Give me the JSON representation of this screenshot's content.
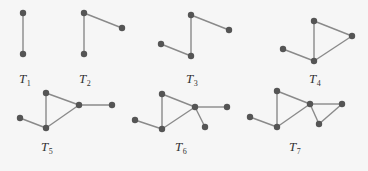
{
  "diagram": {
    "colors": {
      "background": "#f6f6f6",
      "edge": "#8a8a8a",
      "node": "#555555",
      "label": "#333333"
    },
    "graphs": [
      {
        "id": "T1",
        "label_main": "T",
        "label_sub": "1",
        "label_pos": [
          19,
          83
        ],
        "nodes": [
          [
            23,
            13
          ],
          [
            23,
            54
          ]
        ],
        "edges": [
          [
            0,
            1
          ]
        ]
      },
      {
        "id": "T2",
        "label_main": "T",
        "label_sub": "2",
        "label_pos": [
          79,
          83
        ],
        "nodes": [
          [
            84,
            13
          ],
          [
            84,
            54
          ],
          [
            122,
            28
          ]
        ],
        "edges": [
          [
            0,
            1
          ],
          [
            0,
            2
          ]
        ]
      },
      {
        "id": "T3",
        "label_main": "T",
        "label_sub": "3",
        "label_pos": [
          186,
          83
        ],
        "nodes": [
          [
            161,
            44
          ],
          [
            191,
            56
          ],
          [
            191,
            15
          ],
          [
            229,
            30
          ]
        ],
        "edges": [
          [
            0,
            1
          ],
          [
            1,
            2
          ],
          [
            2,
            3
          ]
        ]
      },
      {
        "id": "T4",
        "label_main": "T",
        "label_sub": "4",
        "label_pos": [
          309,
          83
        ],
        "nodes": [
          [
            283,
            49
          ],
          [
            314,
            61
          ],
          [
            314,
            21
          ],
          [
            352,
            36
          ]
        ],
        "edges": [
          [
            0,
            1
          ],
          [
            1,
            2
          ],
          [
            2,
            3
          ],
          [
            1,
            3
          ]
        ]
      },
      {
        "id": "T5",
        "label_main": "T",
        "label_sub": "5",
        "label_pos": [
          41,
          151
        ],
        "nodes": [
          [
            20,
            118
          ],
          [
            46,
            128
          ],
          [
            46,
            93
          ],
          [
            79,
            105
          ],
          [
            112,
            105
          ]
        ],
        "edges": [
          [
            0,
            1
          ],
          [
            1,
            2
          ],
          [
            2,
            3
          ],
          [
            1,
            3
          ],
          [
            3,
            4
          ]
        ]
      },
      {
        "id": "T6",
        "label_main": "T",
        "label_sub": "6",
        "label_pos": [
          175,
          151
        ],
        "nodes": [
          [
            135,
            120
          ],
          [
            162,
            129
          ],
          [
            162,
            94
          ],
          [
            195,
            107
          ],
          [
            227,
            107
          ],
          [
            205,
            127
          ]
        ],
        "edges": [
          [
            0,
            1
          ],
          [
            1,
            2
          ],
          [
            2,
            3
          ],
          [
            1,
            3
          ],
          [
            3,
            4
          ],
          [
            3,
            5
          ]
        ]
      },
      {
        "id": "T7",
        "label_main": "T",
        "label_sub": "7",
        "label_pos": [
          289,
          151
        ],
        "nodes": [
          [
            250,
            117
          ],
          [
            277,
            127
          ],
          [
            277,
            91
          ],
          [
            310,
            104
          ],
          [
            342,
            104
          ],
          [
            319,
            124
          ]
        ],
        "edges": [
          [
            0,
            1
          ],
          [
            1,
            2
          ],
          [
            2,
            3
          ],
          [
            1,
            3
          ],
          [
            3,
            4
          ],
          [
            3,
            5
          ],
          [
            5,
            4
          ]
        ]
      }
    ]
  }
}
